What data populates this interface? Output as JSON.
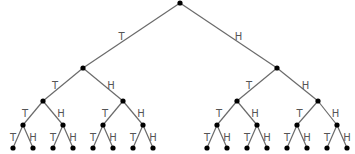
{
  "diagram": {
    "type": "probability-tree",
    "branch_labels": {
      "left": "T",
      "right": "H"
    },
    "colors": {
      "edge": "#6a6a6a",
      "node": "#000000",
      "label": "#555555"
    },
    "levels": [
      {
        "y": 3,
        "xs": [
          180
        ]
      },
      {
        "y": 68,
        "xs": [
          83,
          277
        ]
      },
      {
        "y": 101,
        "xs": [
          43,
          123,
          237,
          318
        ]
      },
      {
        "y": 125,
        "xs": [
          23,
          63,
          103,
          143,
          217,
          257,
          297,
          337
        ]
      },
      {
        "y": 148,
        "xs": [
          13,
          33,
          53,
          73,
          93,
          113,
          133,
          153,
          207,
          227,
          247,
          267,
          287,
          307,
          327,
          347
        ]
      }
    ]
  }
}
